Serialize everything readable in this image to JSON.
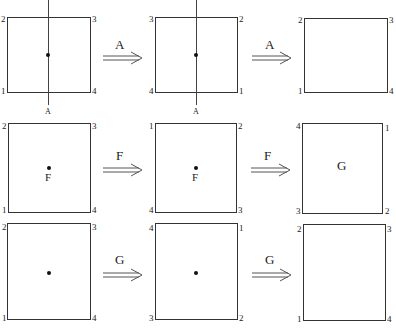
{
  "diagram": {
    "rows": [
      {
        "operation": "A",
        "boxes": [
          {
            "corners": {
              "tl": "2",
              "tr": "3",
              "bl": "1",
              "br": "4"
            },
            "center_dot": true,
            "center_label": "",
            "axis": true,
            "axis_label": "A"
          },
          {
            "corners": {
              "tl": "3",
              "tr": "2",
              "bl": "4",
              "br": "1"
            },
            "center_dot": true,
            "center_label": "",
            "axis": true,
            "axis_label": "A"
          },
          {
            "corners": {
              "tl": "2",
              "tr": "3",
              "bl": "1",
              "br": "4"
            },
            "center_dot": false,
            "center_label": "",
            "axis": false
          }
        ],
        "arrows": [
          {
            "label": "A"
          },
          {
            "label": "A"
          }
        ]
      },
      {
        "operation": "F",
        "boxes": [
          {
            "corners": {
              "tl": "2",
              "tr": "3",
              "bl": "1",
              "br": "4"
            },
            "center_dot": true,
            "center_label": "F"
          },
          {
            "corners": {
              "tl": "1",
              "tr": "2",
              "bl": "4",
              "br": "3"
            },
            "center_dot": true,
            "center_label": "F"
          },
          {
            "corners": {
              "tl": "4",
              "tr": "1",
              "bl": "3",
              "br": "2"
            },
            "center_dot": false,
            "center_label": "G"
          }
        ],
        "arrows": [
          {
            "label": "F"
          },
          {
            "label": "F"
          }
        ]
      },
      {
        "operation": "G",
        "boxes": [
          {
            "corners": {
              "tl": "2",
              "tr": "3",
              "bl": "1",
              "br": "4"
            },
            "center_dot": true,
            "center_label": ""
          },
          {
            "corners": {
              "tl": "4",
              "tr": "1",
              "bl": "3",
              "br": "2"
            },
            "center_dot": true,
            "center_label": ""
          },
          {
            "corners": {
              "tl": "2",
              "tr": "3",
              "bl": "1",
              "br": "4"
            },
            "center_dot": false,
            "center_label": ""
          }
        ],
        "arrows": [
          {
            "label": "G"
          },
          {
            "label": "G"
          }
        ]
      }
    ]
  }
}
